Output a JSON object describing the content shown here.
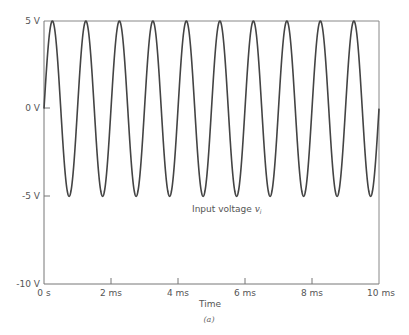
{
  "chart_data": {
    "type": "line",
    "title": "",
    "caption": "(a)",
    "xlabel": "Time",
    "ylabel": "",
    "xlim": [
      0,
      10
    ],
    "ylim": [
      -10,
      5
    ],
    "x_unit": "ms",
    "x_ticks": [
      "0 s",
      "2 ms",
      "4 ms",
      "6 ms",
      "8 ms",
      "10 ms"
    ],
    "y_ticks": [
      "5 V",
      "0 V",
      "-5 V",
      "-10 V"
    ],
    "grid": false,
    "series": [
      {
        "name": "Input voltage v_i",
        "function": "sine",
        "amplitude_V": 5,
        "offset_V": 0,
        "frequency_kHz": 1,
        "phase_deg": 0,
        "color": "#444444"
      }
    ],
    "annotations": [
      {
        "text": "Input voltage ",
        "math": "v",
        "subscript": "i",
        "x_ms": 4.5,
        "y_V": -6.2
      }
    ]
  },
  "labels": {
    "y5": "5 V",
    "y0": "0 V",
    "ym5": "-5 V",
    "ym10": "-10 V",
    "x0": "0 s",
    "x2": "2 ms",
    "x4": "4 ms",
    "x6": "6 ms",
    "x8": "8 ms",
    "x10": "10 ms",
    "xtitle": "Time",
    "caption": "(a)",
    "annot_text": "Input voltage ",
    "annot_math": "v",
    "annot_sub": "i"
  }
}
